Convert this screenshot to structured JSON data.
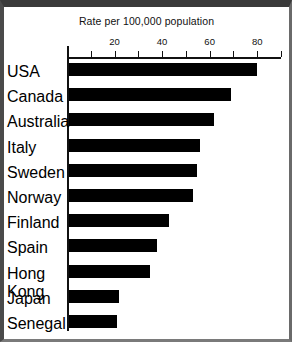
{
  "chart_data": {
    "type": "bar",
    "orientation": "horizontal",
    "title": "Rate per 100,000 population",
    "xlabel": "",
    "ylabel": "",
    "xlim": [
      0,
      90
    ],
    "grid": false,
    "legend": null,
    "tick_values": [
      0,
      10,
      20,
      30,
      40,
      50,
      60,
      70,
      80,
      90
    ],
    "tick_labels": [
      "",
      "",
      "20",
      "",
      "40",
      "",
      "60",
      "",
      "80",
      ""
    ],
    "categories": [
      "USA",
      "Canada",
      "Australia",
      "Italy",
      "Sweden",
      "Norway",
      "Finland",
      "Spain",
      "Hong Kong",
      "Japan",
      "Senegal"
    ],
    "values": [
      79,
      68,
      61,
      55,
      54,
      52,
      42,
      37,
      34,
      21,
      20
    ],
    "bar_color": "#000000",
    "axis_color": "#111111"
  }
}
